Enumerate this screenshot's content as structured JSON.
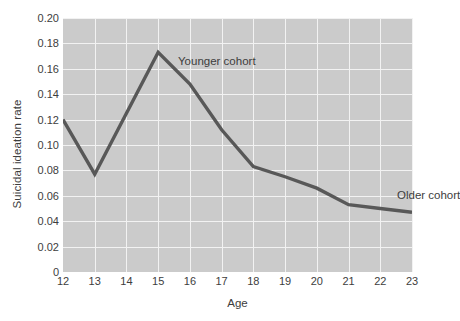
{
  "chart_data": {
    "type": "line",
    "title": "",
    "xlabel": "Age",
    "ylabel": "Suicidal ideation rate",
    "xlim": [
      12,
      23
    ],
    "ylim": [
      0,
      0.2
    ],
    "grid": true,
    "legend_position": "inline-annotations",
    "x": [
      12,
      13,
      14,
      15,
      16,
      17,
      18,
      19,
      20,
      21,
      22,
      23
    ],
    "series": [
      {
        "name": "Suicidal ideation rate",
        "color": "#585858",
        "values": [
          0.12,
          0.077,
          0.125,
          0.173,
          0.148,
          0.112,
          0.083,
          0.075,
          0.066,
          0.053,
          0.05,
          0.047
        ]
      }
    ],
    "x_tick_labels": [
      "12",
      "13",
      "14",
      "15",
      "16",
      "17",
      "18",
      "19",
      "20",
      "21",
      "22",
      "23"
    ],
    "y_tick_labels": [
      "0",
      "0.02",
      "0.04",
      "0.06",
      "0.08",
      "0.10",
      "0.12",
      "0.14",
      "0.16",
      "0.18",
      "0.20"
    ],
    "y_tick_values": [
      0,
      0.02,
      0.04,
      0.06,
      0.08,
      0.1,
      0.12,
      0.14,
      0.16,
      0.18,
      0.2
    ],
    "annotations": [
      {
        "id": "younger",
        "text": "Younger cohort"
      },
      {
        "id": "older",
        "text": "Older cohort"
      }
    ],
    "colors": {
      "plot_background": "#cbcbcb",
      "gridline": "#f2f2f2",
      "line": "#585858",
      "text": "#3d3d3d",
      "page_background": "#ffffff"
    }
  }
}
